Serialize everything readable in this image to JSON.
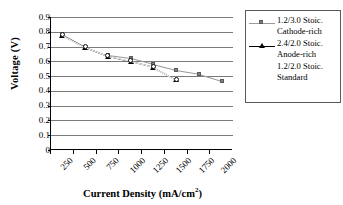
{
  "chart_data": {
    "type": "line",
    "title": "",
    "xlabel": "Current Density (mA/cm2)",
    "xlabel_main": "Current Density (mA/cm",
    "xlabel_sup": "2",
    "xlabel_tail": ")",
    "ylabel": "Voltage (V)",
    "categories": [
      250,
      500,
      750,
      1000,
      1250,
      1500,
      1750,
      2000
    ],
    "xtick_labels": [
      "250",
      "500",
      "750",
      "1000",
      "1250",
      "1500",
      "1750",
      "2000"
    ],
    "ytick_labels": [
      "0.9",
      "0.8",
      "0.7",
      "0.6",
      "0.5",
      "0.4",
      "0.3",
      "0.2",
      "0.1",
      "0"
    ],
    "ylim": [
      0,
      0.9
    ],
    "ystep": 0.1,
    "grid": true,
    "legend_position": "right",
    "series": [
      {
        "name": "1.2/3.0 Stoic. Cathode-rich",
        "label_line1": "1.2/3.0 Stoic.",
        "label_line2": "Cathode-rich",
        "marker": "square",
        "color": "#808080",
        "line_color": "#9a9a9a",
        "x": [
          375,
          625,
          875,
          1125,
          1375,
          1625,
          1875,
          2125
        ],
        "values": [
          0.785,
          0.7,
          0.64,
          0.62,
          0.58,
          0.54,
          0.515,
          0.468
        ]
      },
      {
        "name": "2.4/2.0 Stoic. Anode-rich",
        "label_line1": "2.4/2.0 Stoic.",
        "label_line2": "Anode-rich",
        "marker": "triangle",
        "color": "#000000",
        "line_color": "#000000",
        "x": [
          375,
          625,
          875,
          1125,
          1375,
          1625
        ],
        "values": [
          0.775,
          0.695,
          0.635,
          0.6,
          0.56,
          0.475
        ]
      },
      {
        "name": "1.2/2.0 Stoic. Standard",
        "label_line1": "1.2/2.0 Stoic.",
        "label_line2": "Standard",
        "marker": "circle-open",
        "color": "#ffffff",
        "line_color": "#ffffff",
        "x": [
          375,
          625,
          875,
          1125,
          1375,
          1625
        ],
        "values": [
          0.78,
          0.698,
          0.638,
          0.605,
          0.565,
          0.478
        ]
      }
    ]
  },
  "axes": {
    "y_title": "Voltage (V)"
  },
  "legend": {
    "items": [
      {
        "line1": "1.2/3.0 Stoic.",
        "line2": "Cathode-rich"
      },
      {
        "line1": "2.4/2.0 Stoic.",
        "line2": "Anode-rich"
      },
      {
        "line1": "1.2/2.0 Stoic.",
        "line2": "Standard"
      }
    ]
  }
}
